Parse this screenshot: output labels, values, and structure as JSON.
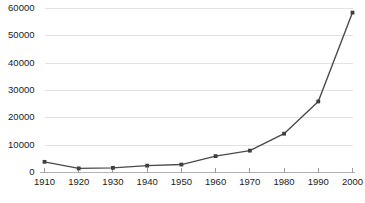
{
  "chart_data": {
    "type": "line",
    "title": "",
    "subtitle": "",
    "xlabel": "",
    "ylabel": "",
    "categories": [
      "1910",
      "1920",
      "1930",
      "1940",
      "1950",
      "1960",
      "1970",
      "1980",
      "1990",
      "2000"
    ],
    "x": [
      1910,
      1920,
      1930,
      1940,
      1950,
      1960,
      1970,
      1980,
      1990,
      2000
    ],
    "values": [
      3900,
      1500,
      1700,
      2500,
      2900,
      6000,
      8000,
      14200,
      26000,
      58500
    ],
    "series": [
      {
        "name": "",
        "values": [
          3900,
          1500,
          1700,
          2500,
          2900,
          6000,
          8000,
          14200,
          26000,
          58500
        ]
      }
    ],
    "xlim": [
      1910,
      2000
    ],
    "ylim": [
      0,
      60000
    ],
    "yticks": [
      0,
      10000,
      20000,
      30000,
      40000,
      50000,
      60000
    ],
    "ytick_labels": [
      "0",
      "10000",
      "20000",
      "30000",
      "40000",
      "50000",
      "60000"
    ],
    "xticks": [
      1910,
      1920,
      1930,
      1940,
      1950,
      1960,
      1970,
      1980,
      1990,
      2000
    ],
    "xtick_labels": [
      "1910",
      "1920",
      "1930",
      "1940",
      "1950",
      "1960",
      "1970",
      "1980",
      "1990",
      "2000"
    ],
    "grid": true,
    "grid_axis": "y",
    "legend": false,
    "legend_position": "none",
    "markers": "square",
    "line_color": "#4a4a4a",
    "marker_color": "#3f3f3f",
    "grid_color": "#e2e2e2",
    "axis_color": "#b4b4b4",
    "background_color": "#ffffff",
    "annotations": []
  }
}
